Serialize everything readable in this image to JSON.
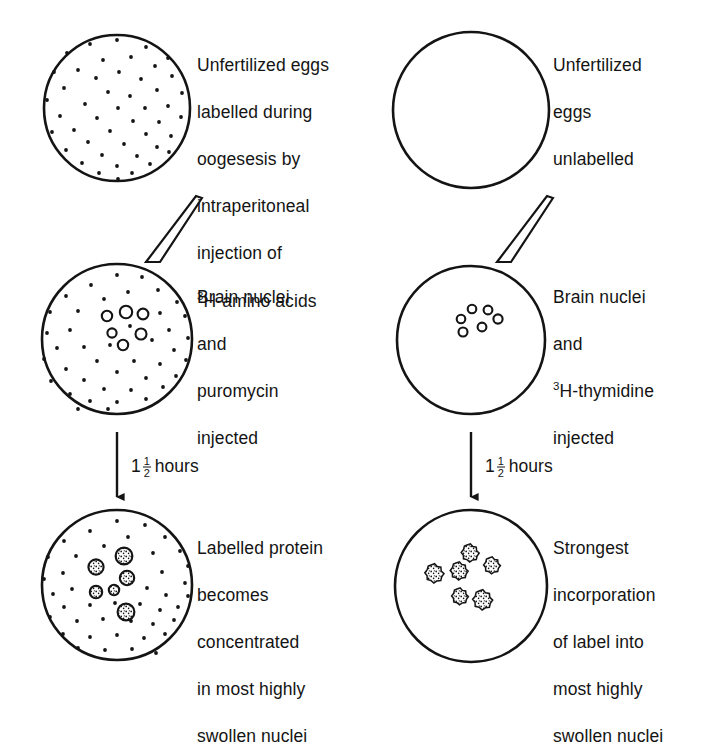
{
  "figure": {
    "type": "experiment-flow-diagram",
    "columns": 2,
    "rows": 3,
    "ink_color": "#141414",
    "background_color": "#ffffff"
  },
  "columns": [
    {
      "id": "left",
      "name": "puromycin-column",
      "steps": [
        {
          "id": "left-step-1",
          "cell_name": "unfertilized-egg-labelled",
          "fill": "dots",
          "nuclei": "none",
          "caption_lines": [
            "Unfertilized eggs",
            "labelled during",
            "oogesesis by",
            "intraperitoneal",
            "injection of"
          ],
          "caption_last_line_sup": "3",
          "caption_last_line": "H-amino acids"
        },
        {
          "id": "left-step-2",
          "cell_name": "egg-with-brain-nuclei-puromycin",
          "fill": "dots",
          "nuclei": "open-rings",
          "caption_lines": [
            "Brain nuclei",
            "and",
            "puromycin",
            "injected"
          ],
          "caption_last_line_sup": "",
          "caption_last_line": ""
        },
        {
          "id": "left-step-3",
          "cell_name": "egg-labelled-protein-concentrated",
          "fill": "dots",
          "nuclei": "stippled-grains",
          "caption_lines": [
            "Labelled protein",
            "becomes",
            "concentrated",
            "in most highly",
            "swollen nuclei"
          ],
          "caption_last_line_sup": "",
          "caption_last_line": ""
        }
      ],
      "connectors": [
        {
          "id": "left-needle",
          "kind": "injection-needle"
        },
        {
          "id": "left-arrow",
          "kind": "down-arrow",
          "label_prefix": "1",
          "label_fraction_num": "1",
          "label_fraction_den": "2",
          "label_suffix": "hours"
        }
      ]
    },
    {
      "id": "right",
      "name": "thymidine-column",
      "steps": [
        {
          "id": "right-step-1",
          "cell_name": "unfertilized-egg-unlabelled",
          "fill": "empty",
          "nuclei": "none",
          "caption_lines": [
            "Unfertilized",
            "eggs",
            "unlabelled"
          ],
          "caption_last_line_sup": "",
          "caption_last_line": ""
        },
        {
          "id": "right-step-2",
          "cell_name": "egg-with-brain-nuclei-thymidine",
          "fill": "empty",
          "nuclei": "open-rings",
          "caption_lines": [
            "Brain nuclei",
            "and"
          ],
          "caption_sup_line_sup": "3",
          "caption_sup_line": "H-thymidine",
          "caption_tail_lines": [
            "injected"
          ]
        },
        {
          "id": "right-step-3",
          "cell_name": "egg-strongest-incorporation",
          "fill": "empty",
          "nuclei": "starburst-grains",
          "caption_lines": [
            "Strongest",
            "incorporation",
            "of label into",
            "most highly",
            "swollen nuclei"
          ],
          "caption_last_line_sup": "",
          "caption_last_line": ""
        }
      ],
      "connectors": [
        {
          "id": "right-needle",
          "kind": "injection-needle"
        },
        {
          "id": "right-arrow",
          "kind": "down-arrow",
          "label_prefix": "1",
          "label_fraction_num": "1",
          "label_fraction_den": "2",
          "label_suffix": "hours"
        }
      ]
    }
  ]
}
